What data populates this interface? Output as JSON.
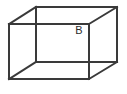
{
  "figure": {
    "kind": "cube-wireframe-diagram",
    "background_color": "#ffffff",
    "line_color": "#3a3a3a",
    "line_width": 2,
    "canvas": {
      "width": 127,
      "height": 94
    },
    "projection": "oblique parallel projection; back face offset up and to the right of the front face",
    "labels": [
      {
        "id": "label-b",
        "text": "B",
        "x": 79,
        "y": 31,
        "font_size": 11,
        "color": "#2b2b2b"
      }
    ],
    "vertices": {
      "front_top_left": {
        "x": 9,
        "y": 24
      },
      "front_top_right": {
        "x": 89,
        "y": 24
      },
      "front_bottom_right": {
        "x": 89,
        "y": 79
      },
      "front_bottom_left": {
        "x": 9,
        "y": 79
      },
      "back_top_left": {
        "x": 36,
        "y": 7
      },
      "back_top_right": {
        "x": 117,
        "y": 7
      },
      "back_bottom_right": {
        "x": 117,
        "y": 62
      },
      "back_bottom_left": {
        "x": 36,
        "y": 62
      }
    },
    "edges": [
      {
        "id": "front-top",
        "name": "front-top-edge",
        "from": "front_top_left",
        "to": "front_top_right"
      },
      {
        "id": "front-right",
        "name": "front-right-edge",
        "from": "front_top_right",
        "to": "front_bottom_right"
      },
      {
        "id": "front-bottom",
        "name": "front-bottom-edge",
        "from": "front_bottom_right",
        "to": "front_bottom_left"
      },
      {
        "id": "front-left",
        "name": "front-left-edge",
        "from": "front_bottom_left",
        "to": "front_top_left"
      },
      {
        "id": "back-top",
        "name": "back-top-edge",
        "from": "back_top_left",
        "to": "back_top_right"
      },
      {
        "id": "back-right",
        "name": "back-right-edge",
        "from": "back_top_right",
        "to": "back_bottom_right"
      },
      {
        "id": "back-bottom",
        "name": "back-bottom-edge",
        "from": "back_bottom_right",
        "to": "back_bottom_left"
      },
      {
        "id": "back-left",
        "name": "back-left-edge",
        "from": "back_bottom_left",
        "to": "back_top_left"
      },
      {
        "id": "connect-top-left",
        "name": "top-left-depth-edge",
        "from": "front_top_left",
        "to": "back_top_left"
      },
      {
        "id": "connect-top-right",
        "name": "top-right-depth-edge",
        "from": "front_top_right",
        "to": "back_top_right"
      },
      {
        "id": "connect-bottom-right",
        "name": "bottom-right-depth-edge",
        "from": "front_bottom_right",
        "to": "back_bottom_right"
      },
      {
        "id": "connect-bottom-left",
        "name": "bottom-left-depth-edge",
        "from": "front_bottom_left",
        "to": "back_bottom_left"
      }
    ]
  }
}
